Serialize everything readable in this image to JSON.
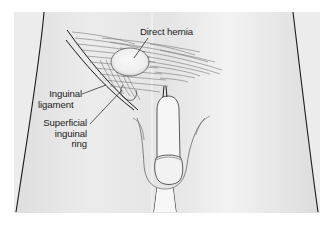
{
  "figure": {
    "type": "anatomical-illustration",
    "labels": {
      "direct_hernia": "Direct hernia",
      "inguinal_ligament_line1": "Inguinal",
      "inguinal_ligament_line2": "ligament",
      "superficial_ring_line1": "Superficial",
      "superficial_ring_line2": "inguinal",
      "superficial_ring_line3": "ring"
    },
    "colors": {
      "background": "#ffffff",
      "panel": "#e6e6e6",
      "panel_light": "#f4f4f4",
      "line": "#1a1a1a",
      "muscle_fibers": "#6e6e6e"
    }
  }
}
